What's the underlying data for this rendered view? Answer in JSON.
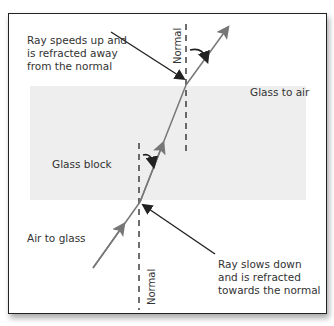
{
  "labels": {
    "top_left": "Ray speeds up and\nis refracted away\nfrom the normal",
    "glass_to_air": "Glass to air",
    "glass_block": "Glass block",
    "air_to_glass": "Air to glass",
    "bottom_right": "Ray slows down\nand is refracted\ntowards the normal",
    "normal_top": "Normal",
    "normal_bottom": "Normal"
  },
  "colors": {
    "ray": "#777777",
    "pointer": "#222222",
    "block": "#eeeeee"
  }
}
